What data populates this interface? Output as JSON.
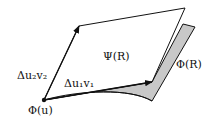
{
  "diagram": {
    "labels": {
      "psi_r": "Ψ(R)",
      "phi_r": "Φ(R)",
      "phi_u": "Φ(u)",
      "du2v2": "Δu₂v₂",
      "du1v1": "Δu₁v₁"
    },
    "colors": {
      "stroke": "#111111",
      "surface_fill": "#c8c8c8",
      "parallelogram_fill": "#ffffff"
    }
  }
}
